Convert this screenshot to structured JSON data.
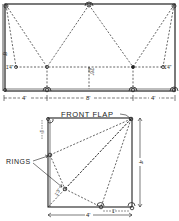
{
  "diagram": {
    "top_plan": {
      "left_height_label": "8'",
      "left_point_label": "1'4\"",
      "right_point_label": "1'4\"",
      "center_vertical_label": "2'6\"",
      "bottom_dims": [
        "4'",
        "8'",
        "4'"
      ]
    },
    "front_flap": {
      "title": "FRONT FLAP",
      "rings_label": "RINGS",
      "right_height_label": "4'",
      "bottom_width_label": "4'",
      "top_left_small_label": "1'",
      "bottom_right_small_label": "1'",
      "bottom_small_label": "1'",
      "diagonal_label": "1'3\""
    },
    "colors": {
      "line": "#222222",
      "background": "#ffffff"
    }
  }
}
